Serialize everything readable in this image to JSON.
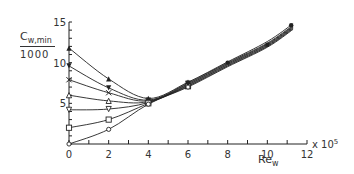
{
  "chart_data": {
    "type": "line",
    "title": "",
    "ylabel_top": "C",
    "ylabel_sub": "w,min",
    "ylabel_bottom": "1000",
    "xlabel": "Re",
    "xlabel_sub": "w",
    "x_multiplier": "x 10",
    "x_multiplier_exp": "5",
    "xlim": [
      0,
      12
    ],
    "ylim": [
      0,
      15
    ],
    "x_ticks": [
      "0",
      "2",
      "4",
      "6",
      "8",
      "10",
      "12"
    ],
    "y_ticks": [
      "0",
      "5",
      "10",
      "15"
    ],
    "grid": false,
    "series": [
      {
        "marker": "filled-triangle-up",
        "x": [
          0,
          2,
          4,
          6,
          8,
          10,
          11.3
        ],
        "y": [
          11.8,
          8.0,
          5.6,
          7.6,
          10.1,
          12.6,
          14.8
        ]
      },
      {
        "marker": "filled-triangle-down",
        "x": [
          0,
          2,
          4,
          6,
          8,
          10,
          11.3
        ],
        "y": [
          9.6,
          6.9,
          5.4,
          7.5,
          10.0,
          12.4,
          14.6
        ]
      },
      {
        "marker": "cross",
        "x": [
          0,
          2,
          4,
          6,
          8,
          10,
          11.3
        ],
        "y": [
          7.9,
          6.3,
          5.3,
          7.4,
          9.9,
          12.3,
          14.5
        ]
      },
      {
        "marker": "open-triangle-up",
        "x": [
          0,
          2,
          4,
          6,
          8,
          10,
          11.3
        ],
        "y": [
          6.0,
          5.3,
          5.2,
          7.3,
          9.8,
          12.2,
          14.4
        ]
      },
      {
        "marker": "open-triangle-down",
        "x": [
          0,
          2,
          4,
          6,
          8,
          10,
          11.3
        ],
        "y": [
          4.2,
          4.3,
          5.1,
          7.2,
          9.7,
          12.1,
          14.3
        ]
      },
      {
        "marker": "open-square",
        "x": [
          0,
          2,
          4,
          6,
          8,
          10,
          11.3
        ],
        "y": [
          2.0,
          3.0,
          5.0,
          7.1,
          9.6,
          12.0,
          14.2
        ]
      },
      {
        "marker": "open-circle",
        "x": [
          0,
          2,
          4,
          6,
          8,
          10,
          11.3
        ],
        "y": [
          0,
          1.8,
          4.9,
          7.0,
          9.5,
          11.9,
          14.1
        ]
      }
    ]
  }
}
